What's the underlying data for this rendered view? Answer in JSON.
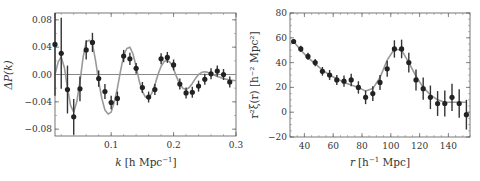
{
  "chart_data": [
    {
      "type": "scatter",
      "title": "",
      "xlabel": "k [h Mpc^-1]",
      "ylabel": "ΔP(k)",
      "xlim": [
        0.01,
        0.3
      ],
      "ylim": [
        -0.09,
        0.09
      ],
      "grid": false,
      "xticks": [
        "0.1",
        "0.2",
        "0.3"
      ],
      "yticks": [
        "0.08",
        "0.04",
        "0.00",
        "−0.04",
        "−0.08"
      ],
      "x_label_parts": {
        "var": "k",
        "unit": "[h Mpc",
        "exp": "−1",
        "close": "]"
      },
      "y_label_text": "ΔP(k)",
      "reference_line": 0.0,
      "series": [
        {
          "name": "data",
          "x": [
            0.01,
            0.02,
            0.03,
            0.04,
            0.05,
            0.06,
            0.07,
            0.08,
            0.09,
            0.1,
            0.11,
            0.12,
            0.13,
            0.14,
            0.15,
            0.16,
            0.17,
            0.18,
            0.19,
            0.2,
            0.21,
            0.22,
            0.23,
            0.24,
            0.25,
            0.26,
            0.27,
            0.28,
            0.29
          ],
          "y": [
            0.044,
            0.031,
            -0.022,
            -0.062,
            -0.021,
            0.036,
            0.047,
            -0.006,
            -0.025,
            -0.041,
            -0.035,
            0.027,
            0.023,
            0.009,
            -0.019,
            -0.033,
            -0.022,
            0.023,
            0.025,
            0.014,
            -0.014,
            -0.027,
            -0.026,
            -0.017,
            -0.007,
            0.001,
            0.005,
            0.0,
            -0.011
          ],
          "yerr": [
            0.075,
            0.052,
            0.035,
            0.026,
            0.018,
            0.014,
            0.014,
            0.012,
            0.011,
            0.01,
            0.01,
            0.009,
            0.009,
            0.008,
            0.008,
            0.008,
            0.008,
            0.008,
            0.008,
            0.008,
            0.008,
            0.008,
            0.008,
            0.008,
            0.008,
            0.008,
            0.008,
            0.008,
            0.008
          ]
        },
        {
          "name": "model",
          "x": [
            0.01,
            0.015,
            0.02,
            0.025,
            0.03,
            0.035,
            0.04,
            0.045,
            0.05,
            0.055,
            0.06,
            0.065,
            0.07,
            0.075,
            0.08,
            0.085,
            0.09,
            0.095,
            0.1,
            0.105,
            0.11,
            0.115,
            0.12,
            0.125,
            0.13,
            0.135,
            0.14,
            0.145,
            0.15,
            0.155,
            0.16,
            0.165,
            0.17,
            0.175,
            0.18,
            0.185,
            0.19,
            0.195,
            0.2,
            0.205,
            0.21,
            0.215,
            0.22,
            0.225,
            0.23,
            0.235,
            0.24,
            0.245,
            0.25,
            0.255,
            0.26,
            0.27,
            0.28,
            0.29,
            0.3
          ],
          "y": [
            0.0,
            0.018,
            0.026,
            0.01,
            -0.02,
            -0.045,
            -0.055,
            -0.04,
            -0.01,
            0.025,
            0.048,
            0.05,
            0.045,
            0.02,
            -0.01,
            -0.035,
            -0.052,
            -0.058,
            -0.055,
            -0.04,
            -0.02,
            0.005,
            0.028,
            0.038,
            0.04,
            0.03,
            0.012,
            -0.01,
            -0.025,
            -0.033,
            -0.034,
            -0.028,
            -0.015,
            0.0,
            0.012,
            0.019,
            0.021,
            0.017,
            0.008,
            -0.004,
            -0.014,
            -0.02,
            -0.022,
            -0.019,
            -0.013,
            -0.006,
            0.0,
            0.003,
            0.004,
            0.003,
            0.001,
            -0.003,
            -0.006,
            -0.008,
            -0.009
          ]
        }
      ]
    },
    {
      "type": "scatter",
      "title": "",
      "xlabel": "r [h^-1 Mpc]",
      "ylabel": "r^2 ξ(r) [h^-2 Mpc^2]",
      "xlim": [
        30,
        155
      ],
      "ylim": [
        -20,
        80
      ],
      "grid": false,
      "xticks": [
        "40",
        "60",
        "80",
        "100",
        "120",
        "140"
      ],
      "yticks": [
        "80",
        "60",
        "40",
        "20",
        "0",
        "−20"
      ],
      "x_label_parts": {
        "var": "r",
        "unit": "[h",
        "exp": "−1",
        "close": " Mpc]"
      },
      "y_label_text": "r²ξ(r) [h⁻² Mpc²]",
      "series": [
        {
          "name": "data",
          "x": [
            32.5,
            37.5,
            42.5,
            47.5,
            52.5,
            57.5,
            62.5,
            67.5,
            72.5,
            77.5,
            82.5,
            87.5,
            92.5,
            97.5,
            102.5,
            107.5,
            112.5,
            117.5,
            122.5,
            127.5,
            132.5,
            137.5,
            142.5,
            147.5,
            152.5
          ],
          "y": [
            57,
            51,
            45,
            40,
            33,
            30,
            26,
            25,
            26,
            20,
            12,
            15,
            24,
            35,
            51,
            51,
            40,
            26,
            19,
            12,
            7,
            7,
            12,
            7,
            -2
          ],
          "yerr": [
            2,
            2.5,
            3,
            3,
            3.5,
            4,
            4,
            4.5,
            5,
            5,
            5.5,
            6,
            6,
            6.5,
            7,
            7.5,
            8,
            8.5,
            9,
            9.5,
            10,
            10.5,
            11,
            11.5,
            12
          ]
        },
        {
          "name": "model",
          "x": [
            32.5,
            37.5,
            42.5,
            47.5,
            52.5,
            57.5,
            62.5,
            67.5,
            72.5,
            77.5,
            82.5,
            87.5,
            92.5,
            97.5,
            102.5,
            107.5,
            112.5,
            117.5,
            122.5,
            127.5,
            132.5,
            137.5,
            142.5,
            147.5,
            152.5
          ],
          "y": [
            57,
            50,
            44,
            39,
            34,
            30,
            27,
            24,
            22,
            20,
            17,
            19,
            28,
            42,
            51,
            50,
            40,
            29,
            20,
            14,
            10,
            8,
            8,
            8,
            8
          ]
        }
      ]
    }
  ]
}
